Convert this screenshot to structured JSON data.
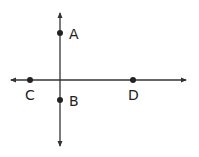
{
  "diagram": {
    "type": "perpendicular-lines",
    "colors": {
      "line": "#333333",
      "point": "#222222",
      "label": "#222222",
      "background": "#ffffff"
    },
    "lines": [
      {
        "id": "vertical-line",
        "x1": 60,
        "y1": 13,
        "x2": 60,
        "y2": 146,
        "arrows": "both"
      },
      {
        "id": "horizontal-line",
        "x1": 11,
        "y1": 80,
        "x2": 186,
        "y2": 80,
        "arrows": "both"
      }
    ],
    "points": [
      {
        "label": "A",
        "x": 60,
        "y": 33,
        "label_x": 69,
        "label_y": 39
      },
      {
        "label": "B",
        "x": 60,
        "y": 100,
        "label_x": 69,
        "label_y": 106
      },
      {
        "label": "C",
        "x": 30,
        "y": 80,
        "label_x": 25,
        "label_y": 100
      },
      {
        "label": "D",
        "x": 133,
        "y": 80,
        "label_x": 128,
        "label_y": 100
      }
    ]
  }
}
